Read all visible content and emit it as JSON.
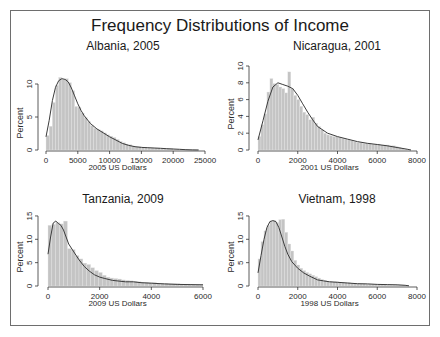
{
  "figure": {
    "title": "Frequency Distributions of Income"
  },
  "chart_data": [
    {
      "type": "bar",
      "title": "Albania, 2005",
      "xlabel": "2005 US Dollars",
      "ylabel": "Percent",
      "xlim": [
        0,
        25000
      ],
      "ylim": [
        0,
        12
      ],
      "xticks": [
        0,
        5000,
        10000,
        15000,
        20000,
        25000
      ],
      "yticks": [
        0,
        5,
        10
      ],
      "bin_width": 500,
      "values": [
        2.2,
        3.6,
        7.2,
        9.8,
        11.0,
        10.7,
        10.8,
        10.2,
        9.0,
        6.6,
        6.5,
        5.6,
        4.9,
        4.3,
        3.7,
        3.3,
        3.1,
        2.9,
        2.6,
        2.3,
        2.1,
        1.9,
        1.6,
        1.3,
        1.1,
        0.9,
        0.8,
        0.6,
        0.5,
        0.5,
        0.4,
        0.4,
        0.3,
        0.3,
        0.3,
        0.3,
        0.2,
        0.2,
        0.2,
        0.2,
        0.1,
        0.1,
        0.1,
        0.1,
        0.1,
        0.05,
        0.05,
        0.05,
        0.0,
        0.0
      ],
      "density_curve": [
        [
          0,
          2.0
        ],
        [
          500,
          4.5
        ],
        [
          1000,
          7.5
        ],
        [
          1500,
          9.5
        ],
        [
          2000,
          10.5
        ],
        [
          2500,
          10.8
        ],
        [
          3000,
          10.7
        ],
        [
          3500,
          10.3
        ],
        [
          4000,
          9.4
        ],
        [
          4500,
          8.2
        ],
        [
          5000,
          7.0
        ],
        [
          5500,
          6.0
        ],
        [
          6000,
          5.2
        ],
        [
          7000,
          4.0
        ],
        [
          8000,
          3.2
        ],
        [
          9000,
          2.6
        ],
        [
          10000,
          2.0
        ],
        [
          11000,
          1.5
        ],
        [
          12000,
          1.0
        ],
        [
          13000,
          0.7
        ],
        [
          14000,
          0.5
        ],
        [
          15000,
          0.4
        ],
        [
          16000,
          0.35
        ],
        [
          17000,
          0.3
        ],
        [
          18000,
          0.25
        ],
        [
          19000,
          0.2
        ],
        [
          20000,
          0.15
        ],
        [
          21000,
          0.1
        ],
        [
          22000,
          0.05
        ],
        [
          23000,
          0.02
        ],
        [
          24000,
          0.0
        ]
      ]
    },
    {
      "type": "bar",
      "title": "Nicaragua, 2001",
      "xlabel": "2001 US Dollars",
      "ylabel": "Percent",
      "xlim": [
        0,
        8000
      ],
      "ylim": [
        0,
        10
      ],
      "xticks": [
        0,
        2000,
        4000,
        6000,
        8000
      ],
      "yticks": [
        0,
        2,
        4,
        6,
        8,
        10
      ],
      "bin_width": 150,
      "values": [
        1.6,
        3.0,
        4.3,
        6.9,
        8.5,
        7.9,
        7.8,
        7.5,
        7.3,
        6.8,
        9.3,
        7.3,
        6.5,
        6.0,
        5.2,
        4.5,
        4.2,
        3.6,
        3.9,
        3.2,
        2.8,
        2.4,
        2.0,
        1.8,
        1.7,
        1.6,
        1.6,
        1.5,
        1.4,
        1.3,
        1.2,
        1.1,
        1.0,
        0.9,
        0.9,
        0.8,
        0.8,
        0.8,
        0.7,
        0.7,
        0.7,
        0.6,
        0.6,
        0.6,
        0.5,
        0.5,
        0.4,
        0.3,
        0.2,
        0.1
      ],
      "density_curve": [
        [
          0,
          1.2
        ],
        [
          250,
          3.5
        ],
        [
          500,
          5.8
        ],
        [
          750,
          7.5
        ],
        [
          1000,
          8.0
        ],
        [
          1250,
          7.8
        ],
        [
          1500,
          7.6
        ],
        [
          1750,
          7.3
        ],
        [
          2000,
          6.5
        ],
        [
          2250,
          5.5
        ],
        [
          2500,
          4.5
        ],
        [
          2750,
          3.6
        ],
        [
          3000,
          2.8
        ],
        [
          3500,
          2.0
        ],
        [
          4000,
          1.6
        ],
        [
          4500,
          1.3
        ],
        [
          5000,
          1.0
        ],
        [
          5500,
          0.8
        ],
        [
          6000,
          0.65
        ],
        [
          6500,
          0.5
        ],
        [
          7000,
          0.3
        ],
        [
          7500,
          0.1
        ],
        [
          7700,
          0.0
        ]
      ]
    },
    {
      "type": "bar",
      "title": "Tanzania, 2009",
      "xlabel": "2009 US Dollars",
      "ylabel": "Percent",
      "xlim": [
        0,
        6000
      ],
      "ylim": [
        0,
        16
      ],
      "xticks": [
        0,
        2000,
        4000,
        6000
      ],
      "yticks": [
        0,
        5,
        10,
        15
      ],
      "bin_width": 150,
      "values": [
        13.0,
        13.2,
        13.6,
        13.3,
        13.9,
        8.0,
        7.8,
        6.5,
        5.8,
        4.9,
        4.6,
        3.9,
        3.3,
        2.9,
        2.3,
        1.9,
        1.7,
        1.6,
        1.5,
        1.3,
        1.2,
        1.1,
        1.0,
        0.9,
        0.8,
        0.8,
        0.7,
        0.7,
        0.6,
        0.6,
        0.6,
        0.5,
        0.5,
        0.5,
        0.4,
        0.4,
        0.4,
        0.3,
        0.3,
        0.3
      ],
      "density_curve": [
        [
          0,
          6.8
        ],
        [
          100,
          10.5
        ],
        [
          200,
          13.5
        ],
        [
          300,
          13.9
        ],
        [
          400,
          13.4
        ],
        [
          500,
          13.0
        ],
        [
          600,
          12.0
        ],
        [
          700,
          10.5
        ],
        [
          800,
          9.0
        ],
        [
          1000,
          7.3
        ],
        [
          1200,
          5.6
        ],
        [
          1400,
          4.2
        ],
        [
          1600,
          3.2
        ],
        [
          1800,
          2.4
        ],
        [
          2000,
          1.9
        ],
        [
          2200,
          1.6
        ],
        [
          2500,
          1.2
        ],
        [
          3000,
          0.9
        ],
        [
          3300,
          0.9
        ],
        [
          3600,
          0.7
        ],
        [
          4000,
          0.6
        ],
        [
          4500,
          0.45
        ],
        [
          5000,
          0.35
        ],
        [
          5500,
          0.3
        ],
        [
          6000,
          0.25
        ]
      ]
    },
    {
      "type": "bar",
      "title": "Vietnam, 1998",
      "xlabel": "1998 US Dollars",
      "ylabel": "Percent",
      "xlim": [
        0,
        8000
      ],
      "ylim": [
        0,
        16
      ],
      "xticks": [
        0,
        2000,
        4000,
        6000,
        8000
      ],
      "yticks": [
        0,
        5,
        10,
        15
      ],
      "bin_width": 150,
      "values": [
        5.8,
        9.5,
        11.8,
        13.0,
        13.9,
        14.0,
        13.6,
        14.2,
        14.3,
        11.5,
        9.0,
        7.5,
        5.5,
        4.5,
        3.8,
        3.3,
        2.9,
        2.6,
        2.3,
        2.0,
        1.7,
        1.4,
        1.2,
        1.0,
        1.0,
        0.9,
        0.9,
        0.8,
        0.8,
        0.7,
        0.7,
        0.6,
        0.6,
        0.5,
        0.5,
        0.5,
        0.4,
        0.4,
        0.4,
        0.3,
        0.3,
        0.3,
        0.3,
        0.2,
        0.2,
        0.2,
        0.2,
        0.2,
        0.2,
        0.1
      ],
      "density_curve": [
        [
          0,
          2.8
        ],
        [
          150,
          6.5
        ],
        [
          300,
          10.0
        ],
        [
          450,
          12.5
        ],
        [
          600,
          13.8
        ],
        [
          750,
          14.0
        ],
        [
          900,
          13.8
        ],
        [
          1050,
          12.5
        ],
        [
          1200,
          10.5
        ],
        [
          1350,
          8.5
        ],
        [
          1500,
          6.8
        ],
        [
          1700,
          5.2
        ],
        [
          2000,
          3.8
        ],
        [
          2300,
          2.8
        ],
        [
          2600,
          2.1
        ],
        [
          3000,
          1.3
        ],
        [
          3300,
          1.1
        ],
        [
          3600,
          0.9
        ],
        [
          4000,
          0.8
        ],
        [
          4500,
          0.65
        ],
        [
          5000,
          0.5
        ],
        [
          5500,
          0.45
        ],
        [
          6000,
          0.35
        ],
        [
          6500,
          0.3
        ],
        [
          7000,
          0.25
        ],
        [
          7400,
          0.15
        ],
        [
          7600,
          0.05
        ]
      ]
    }
  ]
}
